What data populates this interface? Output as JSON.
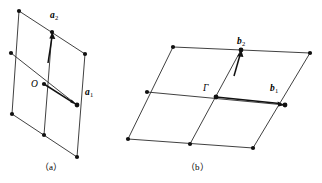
{
  "figure": {
    "panels": [
      {
        "id": "panel-a",
        "caption": "（a）",
        "space": "direct",
        "origin_label": "O",
        "lattice": {
          "rows": 2,
          "cols": 2,
          "node_count": 9,
          "origin": [
            44,
            84
          ],
          "vector_a1": [
            33,
            22
          ],
          "vector_a2": [
            0,
            -42
          ],
          "nodes": [
            [
              19,
              11
            ],
            [
              52,
              32
            ],
            [
              85,
              54
            ],
            [
              11,
              53
            ],
            [
              44,
              84
            ],
            [
              77,
              105
            ],
            [
              12,
              114
            ],
            [
              44,
              135
            ],
            [
              77,
              157
            ]
          ],
          "edges": [
            [
              [
                19,
                11
              ],
              [
                85,
                54
              ]
            ],
            [
              [
                11,
                53
              ],
              [
                77,
                105
              ]
            ],
            [
              [
                12,
                114
              ],
              [
                77,
                157
              ]
            ],
            [
              [
                19,
                11
              ],
              [
                12,
                114
              ]
            ],
            [
              [
                52,
                32
              ],
              [
                44,
                135
              ]
            ],
            [
              [
                85,
                54
              ],
              [
                77,
                157
              ]
            ]
          ]
        },
        "vectors": [
          {
            "name": "a1",
            "label_base": "a",
            "label_sub": "1",
            "from": [
              44,
              84
            ],
            "to": [
              77,
              105
            ],
            "label_pos": [
              85,
              88
            ]
          },
          {
            "name": "a2",
            "label_base": "a",
            "label_sub": "2",
            "from": [
              48,
              63
            ],
            "to": [
              52,
              32
            ],
            "label_pos": [
              50,
              11
            ]
          }
        ]
      },
      {
        "id": "panel-b",
        "caption": "（b）",
        "space": "reciprocal",
        "origin_label": "Γ",
        "lattice": {
          "rows": 2,
          "cols": 2,
          "node_count": 9,
          "origin": [
            216,
            97
          ],
          "vector_b1": [
            69,
            8
          ],
          "vector_b2": [
            17,
            -50
          ],
          "nodes": [
            [
              173,
              47
            ],
            [
              241,
              50
            ],
            [
              310,
              53
            ],
            [
              147,
              92
            ],
            [
              216,
              97
            ],
            [
              285,
              105
            ],
            [
              128,
              139
            ],
            [
              190,
              144
            ],
            [
              253,
              148
            ]
          ],
          "edges": [
            [
              [
                173,
                47
              ],
              [
                310,
                53
              ]
            ],
            [
              [
                147,
                92
              ],
              [
                285,
                105
              ]
            ],
            [
              [
                128,
                139
              ],
              [
                253,
                148
              ]
            ],
            [
              [
                173,
                47
              ],
              [
                128,
                139
              ]
            ],
            [
              [
                241,
                50
              ],
              [
                190,
                144
              ]
            ],
            [
              [
                310,
                53
              ],
              [
                253,
                148
              ]
            ]
          ]
        },
        "vectors": [
          {
            "name": "b1",
            "label_base": "b",
            "label_sub": "1",
            "from": [
              216,
              97
            ],
            "to": [
              285,
              105
            ],
            "label_pos": [
              270,
              84
            ]
          },
          {
            "name": "b2",
            "label_base": "b",
            "label_sub": "2",
            "from": [
              234,
              76
            ],
            "to": [
              241,
              50
            ],
            "label_pos": [
              237,
              37
            ]
          }
        ]
      }
    ],
    "style": {
      "line_color": "#2b2b2b",
      "node_color": "#111111",
      "arrow_color": "#111111",
      "background": "#ffffff"
    }
  }
}
